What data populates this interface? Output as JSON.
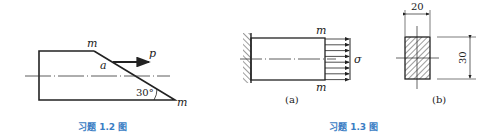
{
  "figure_1_2": {
    "caption": "习题 1.2 图",
    "label_m_top": "m",
    "label_m_bottom": "m",
    "label_a": "a",
    "label_p": "p",
    "angle_label": "30°"
  },
  "figure_1_3": {
    "caption": "习题 1.3 图",
    "sub_a": {
      "label": "(a)",
      "label_m_top": "m",
      "label_m_bottom": "m",
      "label_sigma": "σ"
    },
    "sub_b": {
      "label": "(b)",
      "width_dim": "20",
      "height_dim": "30"
    }
  },
  "colors": {
    "line": "#222222",
    "caption": "#3a7dc4"
  }
}
